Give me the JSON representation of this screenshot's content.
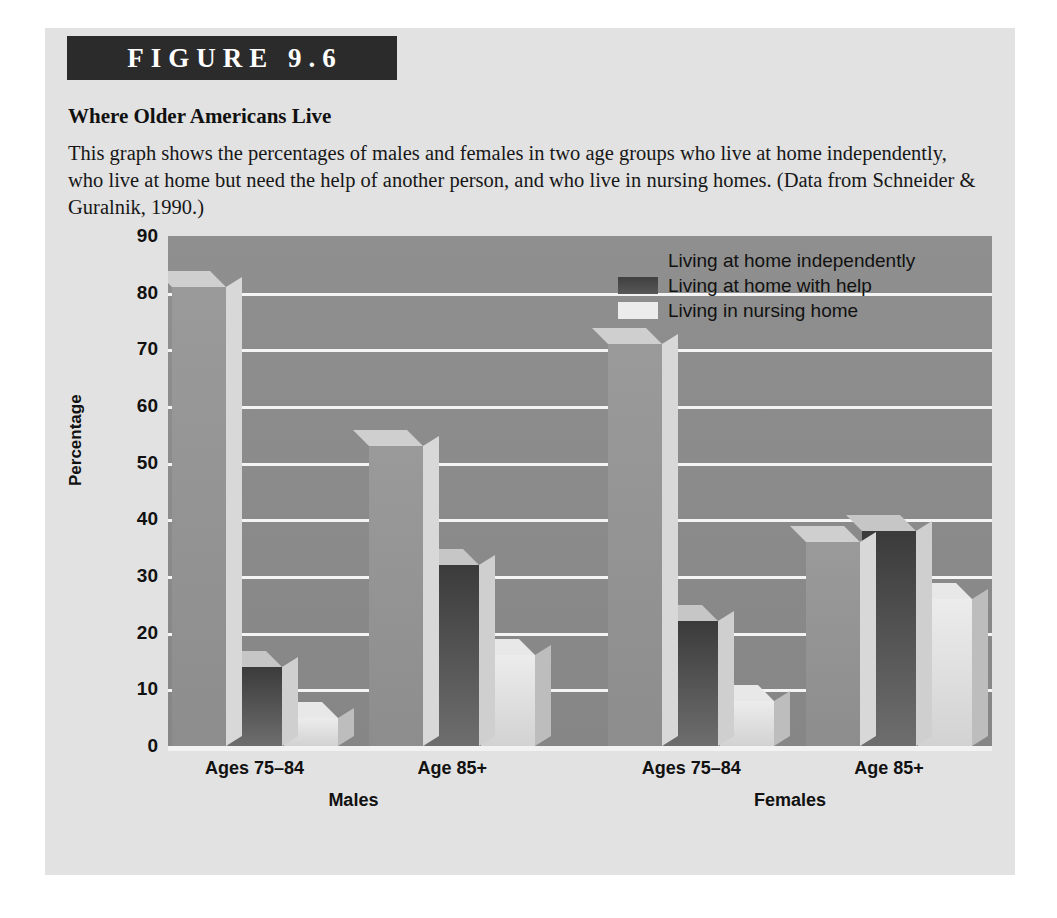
{
  "figure": {
    "number_label": "FIGURE 9.6",
    "title": "Where Older Americans Live",
    "caption": "This graph shows the percentages of males and females in two age groups who live at home independently, who live at home but need the help of another person, and who live in nursing homes. (Data from Schneider & Guralnik, 1990.)"
  },
  "chart_data": {
    "type": "bar",
    "title": "Where Older Americans Live",
    "xlabel": "",
    "ylabel": "Percentage",
    "ylim": [
      0,
      90
    ],
    "ytick_step": 10,
    "yticks": [
      "90",
      "80",
      "70",
      "60",
      "50",
      "40",
      "30",
      "20",
      "10",
      "0"
    ],
    "grid": true,
    "legend_position": "top-right",
    "categories": [
      "Ages 75–84",
      "Age 85+",
      "Ages 75–84",
      "Age 85+"
    ],
    "supergroups": [
      {
        "label": "Males",
        "categories": [
          "Ages 75–84",
          "Age 85+"
        ]
      },
      {
        "label": "Females",
        "categories": [
          "Ages 75–84",
          "Age 85+"
        ]
      }
    ],
    "series": [
      {
        "name": "Living at home independently",
        "values": [
          81,
          53,
          71,
          36
        ],
        "color": "#939393"
      },
      {
        "name": "Living at home with help",
        "values": [
          14,
          32,
          22,
          38
        ],
        "color": "#454545"
      },
      {
        "name": "Living in nursing home",
        "values": [
          5,
          16,
          8,
          26
        ],
        "color": "#e4e4e4"
      }
    ]
  },
  "colors": {
    "panel_background": "#e2e2e2",
    "header_bar": "#2b2b2b",
    "plot_background": "#8c8c8c",
    "gridline": "#f4f4f4",
    "text": "#111111"
  }
}
